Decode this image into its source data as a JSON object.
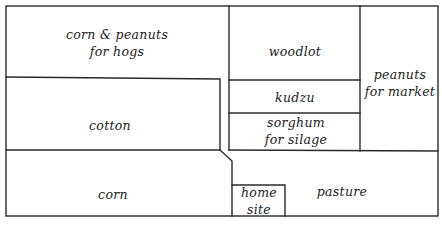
{
  "diagram": {
    "type": "farm-field-layout",
    "colors": {
      "line": "#2a2a2a",
      "text": "#222222",
      "background": "#ffffff"
    },
    "fields": [
      {
        "id": "corn-peanuts-hogs",
        "lines": [
          "corn & peanuts",
          "for hogs"
        ]
      },
      {
        "id": "cotton",
        "lines": [
          "cotton"
        ]
      },
      {
        "id": "corn",
        "lines": [
          "corn"
        ]
      },
      {
        "id": "woodlot",
        "lines": [
          "woodlot"
        ]
      },
      {
        "id": "kudzu",
        "lines": [
          "kudzu"
        ]
      },
      {
        "id": "sorghum",
        "lines": [
          "sorghum",
          "for silage"
        ]
      },
      {
        "id": "peanuts-market",
        "lines": [
          "peanuts",
          "for market"
        ]
      },
      {
        "id": "pasture",
        "lines": [
          "pasture"
        ]
      },
      {
        "id": "home-site",
        "lines": [
          "home",
          "site"
        ]
      }
    ]
  }
}
